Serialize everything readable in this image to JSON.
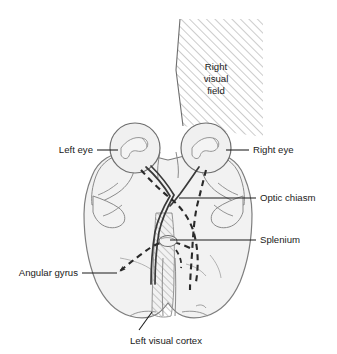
{
  "figure": {
    "type": "anatomical-diagram"
  },
  "labels": {
    "left_eye": "Left eye",
    "right_eye": "Right eye",
    "optic_chiasm": "Optic chiasm",
    "splenium": "Splenium",
    "angular_gyrus": "Angular gyrus",
    "left_visual_cortex": "Left visual cortex",
    "right_visual_field_line1": "Right",
    "right_visual_field_line2": "visual",
    "right_visual_field_line3": "field"
  },
  "colors": {
    "background": "#ffffff",
    "brain_fill": "#f2f2f2",
    "brain_stroke": "#8a8a8a",
    "eye_fill": "#f0f0f0",
    "eye_stroke": "#6e6e6e",
    "hatch_stroke": "#9a9a9a",
    "pathway_stroke": "#3a3a3a",
    "label_text": "#1a1a1a",
    "leader_line": "#1a1a1a"
  },
  "icon_names": {
    "visual_field_wedge": "hatched-wedge-icon",
    "left_eye_globe": "eye-globe-icon",
    "right_eye_globe": "eye-globe-icon",
    "cortex_hatch": "hatched-strip-icon",
    "angular_gyrus_arrow": "dashed-arrow-icon"
  }
}
